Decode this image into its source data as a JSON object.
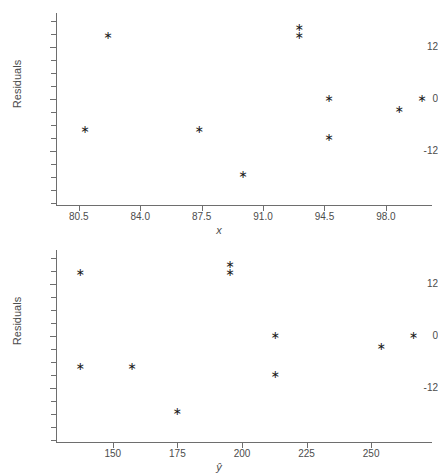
{
  "figure": {
    "width": 438,
    "height": 475,
    "background": "#ffffff",
    "axis_color": "#6e6e6e",
    "text_color": "#4c4c4c",
    "marker_color": "#1a1a1a",
    "marker_glyph": "asterisk"
  },
  "chart_data": [
    {
      "type": "scatter",
      "title": "",
      "xlabel": "x",
      "ylabel": "Residuals",
      "xlim": [
        79.2,
        100.4
      ],
      "ylim": [
        -24.5,
        19.5
      ],
      "grid": false,
      "legend": null,
      "xticks": [
        80.5,
        84.0,
        87.5,
        91.0,
        94.5,
        98.0
      ],
      "xticklabels": [
        "80.5",
        "84.0",
        "87.5",
        "91.0",
        "94.5",
        "98.0"
      ],
      "yticks": [
        12,
        0,
        -12
      ],
      "yticklabels": [
        "12",
        "0",
        "-12"
      ],
      "yminorticks": [
        18,
        15,
        9,
        6,
        3,
        -3,
        -6,
        -9,
        -15,
        -18,
        -21,
        -24
      ],
      "x": [
        80.8,
        82.1,
        87.3,
        89.8,
        93.0,
        93.0,
        94.7,
        94.7,
        98.7,
        100.0
      ],
      "y": [
        -7.0,
        14.5,
        -7.0,
        -17.5,
        16.5,
        14.5,
        0.0,
        -9.0,
        -2.5,
        0.0
      ],
      "points": [
        {
          "x": 80.8,
          "y": -7.0
        },
        {
          "x": 82.1,
          "y": 14.5
        },
        {
          "x": 87.3,
          "y": -7.0
        },
        {
          "x": 89.8,
          "y": -17.5
        },
        {
          "x": 93.0,
          "y": 16.5
        },
        {
          "x": 93.0,
          "y": 14.5
        },
        {
          "x": 94.7,
          "y": 0.0
        },
        {
          "x": 94.7,
          "y": -9.0
        },
        {
          "x": 98.7,
          "y": -2.5
        },
        {
          "x": 100.0,
          "y": 0.0
        }
      ]
    },
    {
      "type": "scatter",
      "title": "",
      "xlabel": "ŷ",
      "ylabel": "Residuals",
      "xlim": [
        128.0,
        272.0
      ],
      "ylim": [
        -24.5,
        19.5
      ],
      "grid": false,
      "legend": null,
      "xticks": [
        150,
        175,
        200,
        225,
        250
      ],
      "xticklabels": [
        "150",
        "175",
        "200",
        "225",
        "250"
      ],
      "yticks": [
        12,
        0,
        -12
      ],
      "yticklabels": [
        "12",
        "0",
        "-12"
      ],
      "yminorticks": [
        18,
        15,
        9,
        6,
        3,
        -3,
        -6,
        -9,
        -15,
        -18,
        -21,
        -24
      ],
      "x": [
        137.0,
        137.0,
        157.0,
        174.5,
        195.0,
        195.0,
        212.5,
        212.5,
        253.5,
        266.0
      ],
      "y": [
        14.5,
        -7.0,
        -7.0,
        -17.5,
        16.5,
        14.5,
        0.0,
        -9.0,
        -2.5,
        0.0
      ],
      "points": [
        {
          "x": 137.0,
          "y": 14.5
        },
        {
          "x": 137.0,
          "y": -7.0
        },
        {
          "x": 157.0,
          "y": -7.0
        },
        {
          "x": 174.5,
          "y": -17.5
        },
        {
          "x": 195.0,
          "y": 16.5
        },
        {
          "x": 195.0,
          "y": 14.5
        },
        {
          "x": 212.5,
          "y": 0.0
        },
        {
          "x": 212.5,
          "y": -9.0
        },
        {
          "x": 253.5,
          "y": -2.5
        },
        {
          "x": 266.0,
          "y": 0.0
        }
      ]
    }
  ]
}
